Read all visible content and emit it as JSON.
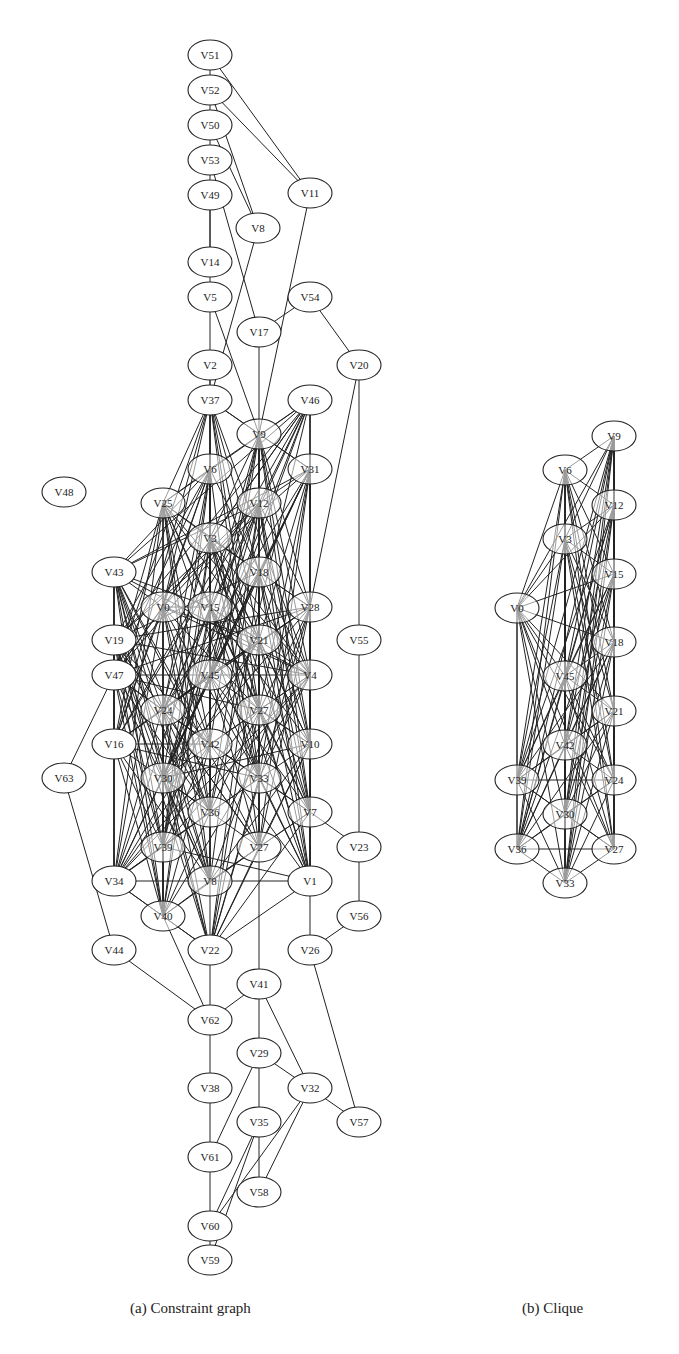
{
  "figure": {
    "panels": [
      {
        "id": "a",
        "caption": "(a) Constraint graph",
        "nodes": [
          {
            "id": "V51",
            "x": 210,
            "y": 55,
            "solid": true
          },
          {
            "id": "V52",
            "x": 210,
            "y": 90,
            "solid": true
          },
          {
            "id": "V50",
            "x": 210,
            "y": 125,
            "solid": true
          },
          {
            "id": "V53",
            "x": 210,
            "y": 160,
            "solid": true
          },
          {
            "id": "V49",
            "x": 210,
            "y": 195,
            "solid": true
          },
          {
            "id": "V11",
            "x": 310,
            "y": 193,
            "solid": true
          },
          {
            "id": "V8",
            "x": 258,
            "y": 228,
            "solid": true
          },
          {
            "id": "V14",
            "x": 210,
            "y": 262,
            "solid": true
          },
          {
            "id": "V5",
            "x": 210,
            "y": 297,
            "solid": true
          },
          {
            "id": "V54",
            "x": 310,
            "y": 297,
            "solid": true
          },
          {
            "id": "V17",
            "x": 259,
            "y": 332,
            "solid": true
          },
          {
            "id": "V20",
            "x": 359,
            "y": 365,
            "solid": true
          },
          {
            "id": "V2",
            "x": 210,
            "y": 365,
            "solid": true
          },
          {
            "id": "V37",
            "x": 210,
            "y": 400,
            "solid": true
          },
          {
            "id": "V46",
            "x": 310,
            "y": 400,
            "solid": true
          },
          {
            "id": "V9",
            "x": 259,
            "y": 434,
            "solid": false
          },
          {
            "id": "V6",
            "x": 210,
            "y": 469,
            "solid": false
          },
          {
            "id": "V31",
            "x": 310,
            "y": 469,
            "solid": false
          },
          {
            "id": "V48",
            "x": 64,
            "y": 492,
            "solid": true
          },
          {
            "id": "V25",
            "x": 163,
            "y": 503,
            "solid": false
          },
          {
            "id": "V12",
            "x": 259,
            "y": 503,
            "solid": false
          },
          {
            "id": "V3",
            "x": 210,
            "y": 538,
            "solid": false
          },
          {
            "id": "V43",
            "x": 114,
            "y": 572,
            "solid": true
          },
          {
            "id": "V18",
            "x": 259,
            "y": 572,
            "solid": false
          },
          {
            "id": "V0",
            "x": 163,
            "y": 607,
            "solid": false
          },
          {
            "id": "V28",
            "x": 310,
            "y": 607,
            "solid": false
          },
          {
            "id": "V15",
            "x": 210,
            "y": 607,
            "solid": false
          },
          {
            "id": "V19",
            "x": 114,
            "y": 640,
            "solid": true
          },
          {
            "id": "V55",
            "x": 359,
            "y": 640,
            "solid": true
          },
          {
            "id": "V21",
            "x": 259,
            "y": 640,
            "solid": false
          },
          {
            "id": "V47",
            "x": 114,
            "y": 675,
            "solid": true
          },
          {
            "id": "V45",
            "x": 210,
            "y": 675,
            "solid": false
          },
          {
            "id": "V4",
            "x": 310,
            "y": 675,
            "solid": false
          },
          {
            "id": "V24",
            "x": 163,
            "y": 710,
            "solid": false
          },
          {
            "id": "V27",
            "x": 259,
            "y": 710,
            "solid": false
          },
          {
            "id": "V16",
            "x": 114,
            "y": 744,
            "solid": true
          },
          {
            "id": "V10",
            "x": 310,
            "y": 744,
            "solid": false
          },
          {
            "id": "V42",
            "x": 210,
            "y": 744,
            "solid": false
          },
          {
            "id": "V63",
            "x": 64,
            "y": 778,
            "solid": true
          },
          {
            "id": "V30",
            "x": 163,
            "y": 778,
            "solid": false
          },
          {
            "id": "V33",
            "x": 259,
            "y": 778,
            "solid": false
          },
          {
            "id": "V36",
            "x": 210,
            "y": 812,
            "solid": false
          },
          {
            "id": "V7",
            "x": 310,
            "y": 812,
            "solid": false
          },
          {
            "id": "V39",
            "x": 163,
            "y": 847,
            "solid": false
          },
          {
            "id": "V23",
            "x": 359,
            "y": 847,
            "solid": true
          },
          {
            "id": "V27b",
            "x": 259,
            "y": 847,
            "solid": false,
            "label": "V27"
          },
          {
            "id": "V34",
            "x": 114,
            "y": 881,
            "solid": true
          },
          {
            "id": "V13",
            "x": 210,
            "y": 881,
            "solid": false,
            "label": "V8"
          },
          {
            "id": "V1",
            "x": 310,
            "y": 881,
            "solid": true
          },
          {
            "id": "V40",
            "x": 163,
            "y": 916,
            "solid": false
          },
          {
            "id": "V56",
            "x": 359,
            "y": 916,
            "solid": true
          },
          {
            "id": "V44",
            "x": 114,
            "y": 950,
            "solid": true
          },
          {
            "id": "V22",
            "x": 210,
            "y": 950,
            "solid": true
          },
          {
            "id": "V26",
            "x": 310,
            "y": 950,
            "solid": true
          },
          {
            "id": "V41",
            "x": 259,
            "y": 984,
            "solid": true
          },
          {
            "id": "V62",
            "x": 210,
            "y": 1020,
            "solid": true
          },
          {
            "id": "V29",
            "x": 259,
            "y": 1053,
            "solid": true
          },
          {
            "id": "V38",
            "x": 210,
            "y": 1088,
            "solid": true
          },
          {
            "id": "V32",
            "x": 310,
            "y": 1088,
            "solid": true
          },
          {
            "id": "V35",
            "x": 259,
            "y": 1122,
            "solid": true
          },
          {
            "id": "V57",
            "x": 359,
            "y": 1122,
            "solid": true
          },
          {
            "id": "V61",
            "x": 210,
            "y": 1157,
            "solid": true
          },
          {
            "id": "V58",
            "x": 259,
            "y": 1192,
            "solid": true
          },
          {
            "id": "V60",
            "x": 210,
            "y": 1226,
            "solid": true
          },
          {
            "id": "V59",
            "x": 210,
            "y": 1260,
            "solid": true
          }
        ],
        "sparse_edges": [
          [
            "V51",
            "V52"
          ],
          [
            "V51",
            "V11"
          ],
          [
            "V52",
            "V11"
          ],
          [
            "V52",
            "V53"
          ],
          [
            "V52",
            "V8"
          ],
          [
            "V50",
            "V8"
          ],
          [
            "V53",
            "V17"
          ],
          [
            "V53",
            "V14"
          ],
          [
            "V49",
            "V14"
          ],
          [
            "V14",
            "V5"
          ],
          [
            "V5",
            "V37"
          ],
          [
            "V5",
            "V9"
          ],
          [
            "V8",
            "V37"
          ],
          [
            "V11",
            "V9"
          ],
          [
            "V54",
            "V17"
          ],
          [
            "V54",
            "V20"
          ],
          [
            "V17",
            "V9"
          ],
          [
            "V2",
            "V37"
          ],
          [
            "V20",
            "V55"
          ],
          [
            "V20",
            "V28"
          ],
          [
            "V55",
            "V23"
          ],
          [
            "V23",
            "V56"
          ],
          [
            "V56",
            "V26"
          ],
          [
            "V7",
            "V23"
          ],
          [
            "V47",
            "V63"
          ],
          [
            "V63",
            "V44"
          ],
          [
            "V44",
            "V62"
          ],
          [
            "V62",
            "V41"
          ],
          [
            "V41",
            "V29"
          ],
          [
            "V41",
            "V32"
          ],
          [
            "V29",
            "V32"
          ],
          [
            "V29",
            "V35"
          ],
          [
            "V32",
            "V57"
          ],
          [
            "V26",
            "V57"
          ],
          [
            "V38",
            "V61"
          ],
          [
            "V61",
            "V60"
          ],
          [
            "V60",
            "V59"
          ],
          [
            "V35",
            "V58"
          ],
          [
            "V35",
            "V60"
          ],
          [
            "V35",
            "V59"
          ],
          [
            "V32",
            "V60"
          ],
          [
            "V32",
            "V58"
          ],
          [
            "V29",
            "V61"
          ],
          [
            "V22",
            "V38"
          ],
          [
            "V34",
            "V22"
          ],
          [
            "V27b",
            "V41"
          ],
          [
            "V1",
            "V26"
          ],
          [
            "V40",
            "V62"
          ],
          [
            "V43",
            "V34"
          ],
          [
            "V16",
            "V34"
          ],
          [
            "V19",
            "V47"
          ]
        ],
        "dense_core": [
          "V37",
          "V46",
          "V9",
          "V6",
          "V31",
          "V25",
          "V12",
          "V3",
          "V43",
          "V18",
          "V0",
          "V28",
          "V15",
          "V19",
          "V21",
          "V47",
          "V45",
          "V4",
          "V24",
          "V27",
          "V16",
          "V10",
          "V42",
          "V30",
          "V33",
          "V36",
          "V7",
          "V39",
          "V27b",
          "V34",
          "V13",
          "V1",
          "V40",
          "V22"
        ]
      },
      {
        "id": "b",
        "caption": "(b) Clique",
        "nodes": [
          {
            "id": "V9",
            "x": 614,
            "y": 436
          },
          {
            "id": "V6",
            "x": 565,
            "y": 470
          },
          {
            "id": "V12",
            "x": 614,
            "y": 505
          },
          {
            "id": "V3",
            "x": 565,
            "y": 539
          },
          {
            "id": "V15",
            "x": 614,
            "y": 574
          },
          {
            "id": "V0",
            "x": 517,
            "y": 608
          },
          {
            "id": "V18",
            "x": 614,
            "y": 642
          },
          {
            "id": "V45",
            "x": 565,
            "y": 676
          },
          {
            "id": "V21",
            "x": 614,
            "y": 711
          },
          {
            "id": "V42",
            "x": 565,
            "y": 745
          },
          {
            "id": "V39",
            "x": 517,
            "y": 780
          },
          {
            "id": "V24",
            "x": 614,
            "y": 780
          },
          {
            "id": "V30",
            "x": 565,
            "y": 814
          },
          {
            "id": "V36",
            "x": 517,
            "y": 849
          },
          {
            "id": "V27",
            "x": 614,
            "y": 849
          },
          {
            "id": "V33",
            "x": 565,
            "y": 883
          }
        ]
      }
    ]
  },
  "captions": {
    "a": "(a) Constraint graph",
    "b": "(b) Clique"
  }
}
